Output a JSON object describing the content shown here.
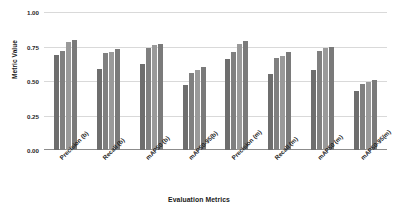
{
  "chart_data": {
    "type": "bar",
    "title": "",
    "xlabel": "Evaluation Metrics",
    "ylabel": "Metric Value",
    "ylim": [
      0.0,
      1.0
    ],
    "yticks": [
      "0.00",
      "0.25",
      "0.50",
      "0.75",
      "1.00"
    ],
    "ytick_values": [
      0.0,
      0.25,
      0.5,
      0.75,
      1.0
    ],
    "grid": true,
    "legend": "none",
    "categories": [
      "Precision (b)",
      "Recall (b)",
      "mAP50 (b)",
      "mAP50-95(b)",
      "Precision (m)",
      "Recall (m)",
      "mAP50 (m)",
      "mAP50-95(m)"
    ],
    "series": [
      {
        "name": "series-1",
        "color": "#6e6e6e",
        "values": [
          0.69,
          0.59,
          0.62,
          0.47,
          0.66,
          0.55,
          0.58,
          0.43
        ]
      },
      {
        "name": "series-2",
        "color": "#808080",
        "values": [
          0.72,
          0.7,
          0.74,
          0.56,
          0.71,
          0.67,
          0.72,
          0.48
        ]
      },
      {
        "name": "series-3",
        "color": "#9a9a9a",
        "values": [
          0.78,
          0.71,
          0.76,
          0.58,
          0.77,
          0.68,
          0.74,
          0.49
        ]
      },
      {
        "name": "series-4",
        "color": "#7a7a7a",
        "values": [
          0.8,
          0.73,
          0.77,
          0.6,
          0.79,
          0.71,
          0.75,
          0.51
        ]
      }
    ]
  }
}
